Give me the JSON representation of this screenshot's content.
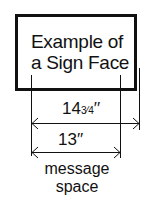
{
  "sign": {
    "line1": "Example of",
    "line2": "a Sign Face"
  },
  "dimensions": {
    "overall": {
      "whole": "14",
      "fraction": "3⁄4",
      "unit": "′′"
    },
    "message": {
      "value": "13′′"
    }
  },
  "caption": {
    "line1": "message",
    "line2": "space"
  }
}
